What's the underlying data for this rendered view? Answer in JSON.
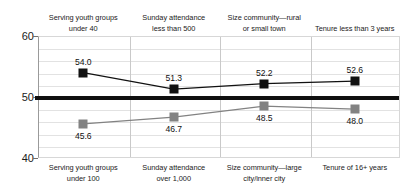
{
  "chart_data": {
    "type": "line",
    "title": "",
    "xlabel": "",
    "ylabel": "",
    "ylim": [
      40,
      60
    ],
    "yticks": [
      40,
      50,
      60
    ],
    "ytick_labels": [
      "40",
      "50",
      "60"
    ],
    "grid": true,
    "gridline_interval": 2,
    "legend": "none",
    "reference_line": 50,
    "categories": [
      "group-1",
      "group-2",
      "group-3",
      "group-4"
    ],
    "series": [
      {
        "name": "upper",
        "marker": "black-square",
        "color": "#111111",
        "labels": [
          "Serving youth groups under 40",
          "Sunday attendance less than 500",
          "Size community—rural or small town",
          "Tenure less than 3 years"
        ],
        "values": [
          54.0,
          51.3,
          52.2,
          52.6
        ],
        "value_labels": [
          "54.0",
          "51.3",
          "52.2",
          "52.6"
        ]
      },
      {
        "name": "lower",
        "marker": "gray-square",
        "color": "#828282",
        "labels": [
          "Serving youth groups under 100",
          "Sunday attendance over 1,000",
          "Size community—large city/inner city",
          "Tenure of 16+ years"
        ],
        "values": [
          45.6,
          46.7,
          48.5,
          48.0
        ],
        "value_labels": [
          "45.6",
          "46.7",
          "48.5",
          "48.0"
        ]
      }
    ]
  },
  "axis": {
    "ticks": [
      {
        "label": "60",
        "value": 60
      },
      {
        "label": "50",
        "value": 50
      },
      {
        "label": "40",
        "value": 40
      }
    ]
  },
  "top_labels": [
    {
      "line1": "Serving youth groups",
      "line2": "under 40"
    },
    {
      "line1": "Sunday attendance",
      "line2": "less than 500"
    },
    {
      "line1": "Size community—rural",
      "line2": "or small town"
    },
    {
      "line1": "Tenure less than 3 years",
      "line2": ""
    }
  ],
  "bottom_labels": [
    {
      "line1": "Serving youth groups",
      "line2": "under 100"
    },
    {
      "line1": "Sunday attendance",
      "line2": "over 1,000"
    },
    {
      "line1": "Size community—large",
      "line2": "city/inner city"
    },
    {
      "line1": "Tenure of 16+ years",
      "line2": ""
    }
  ],
  "colors": {
    "upper_series": "#111111",
    "lower_series": "#828282",
    "reference_line": "#101010",
    "gridline": "#e2e2e2",
    "divider": "#c9c9c9"
  }
}
